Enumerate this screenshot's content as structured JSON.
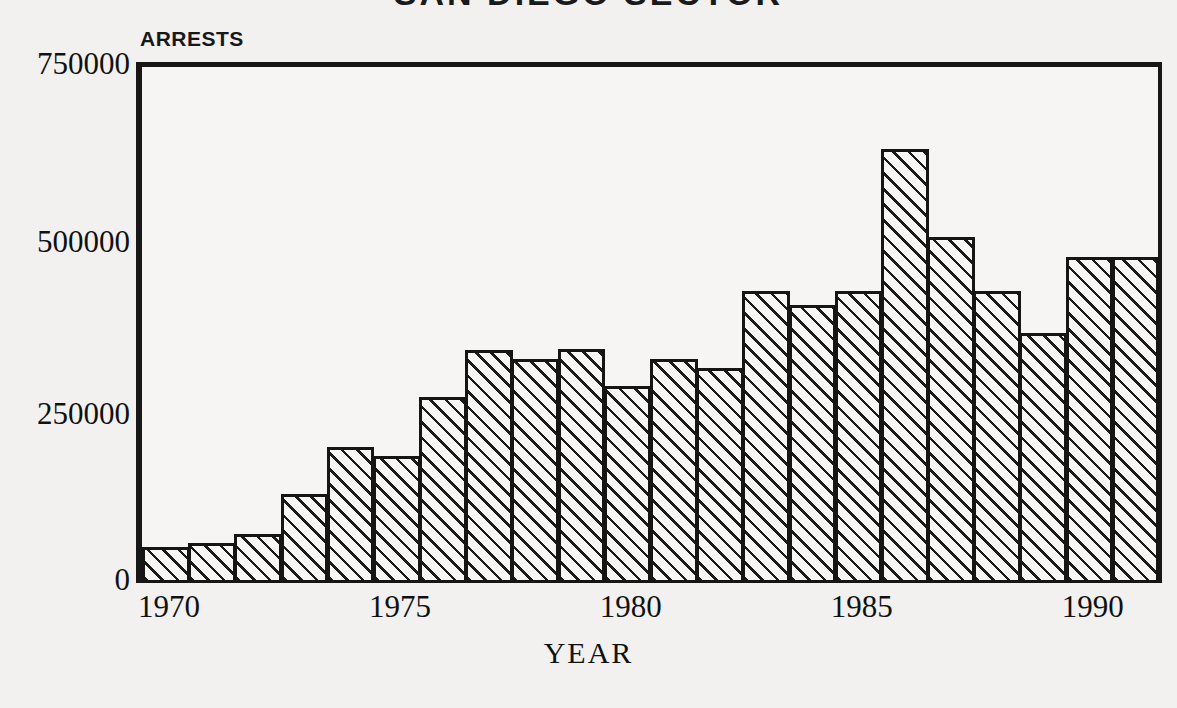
{
  "chart_data": {
    "type": "bar",
    "title": "SAN DIEGO SECTOR",
    "xlabel": "YEAR",
    "ylabel": "ARRESTS",
    "ylim": [
      0,
      750000
    ],
    "xlim": [
      1970,
      1992
    ],
    "grid": "horizontal dashed at 250000 and 500000",
    "legend": "none",
    "y_ticks": [
      "0",
      "250000",
      "500000",
      "750000"
    ],
    "y_tick_values": [
      0,
      250000,
      500000,
      750000
    ],
    "y_minor_tick_step": 50000,
    "x_ticks": [
      "1970",
      "1975",
      "1980",
      "1985",
      "1990"
    ],
    "x_tick_values": [
      1970,
      1975,
      1980,
      1985,
      1990
    ],
    "categories": [
      1970,
      1971,
      1972,
      1973,
      1974,
      1975,
      1976,
      1977,
      1978,
      1979,
      1980,
      1981,
      1982,
      1983,
      1984,
      1985,
      1986,
      1987,
      1988,
      1989,
      1990,
      1991
    ],
    "values": [
      52000,
      58000,
      71000,
      128000,
      196000,
      183000,
      268000,
      335000,
      322000,
      337000,
      283000,
      322000,
      310000,
      420000,
      400000,
      420000,
      625000,
      498000,
      420000,
      360000,
      470000,
      470000
    ],
    "series": [
      {
        "name": "Arrests",
        "values": [
          52000,
          58000,
          71000,
          128000,
          196000,
          183000,
          268000,
          335000,
          322000,
          337000,
          283000,
          322000,
          310000,
          420000,
          400000,
          420000,
          625000,
          498000,
          420000,
          360000,
          470000,
          470000
        ]
      }
    ],
    "bar_fill": "diagonal-hatch",
    "colors": {
      "ink": "#151515",
      "paper": "#f2f1ef",
      "plot_bg": "#f6f5f3",
      "hatch": "#1b1b1b"
    }
  }
}
